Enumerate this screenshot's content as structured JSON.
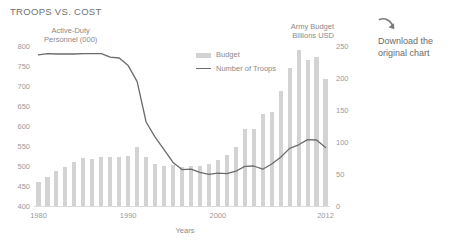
{
  "chart_data": {
    "type": "bar",
    "title": "TROOPS VS. COST",
    "xlabel": "Years",
    "ylabel": "Active-Duty Personnel (000)",
    "y2label": "Army Budget Billions USD",
    "ylim": [
      400,
      800
    ],
    "y2lim": [
      0,
      250
    ],
    "ytick_labels": [
      "800",
      "750",
      "700",
      "650",
      "600",
      "550",
      "500",
      "450",
      "400"
    ],
    "ytick_values": [
      800,
      750,
      700,
      650,
      600,
      550,
      500,
      450,
      400
    ],
    "y2tick_labels": [
      "250",
      "200",
      "150",
      "100",
      "50",
      "0"
    ],
    "y2tick_values": [
      250,
      200,
      150,
      100,
      50,
      0
    ],
    "xtick_labels": [
      "1980",
      "1990",
      "2000",
      "2012"
    ],
    "xtick_values": [
      1980,
      1990,
      2000,
      2012
    ],
    "grid": false,
    "legend_position": "inside-top-center",
    "categories": [
      1980,
      1981,
      1982,
      1983,
      1984,
      1985,
      1986,
      1987,
      1988,
      1989,
      1990,
      1991,
      1992,
      1993,
      1994,
      1995,
      1996,
      1997,
      1998,
      1999,
      2000,
      2001,
      2002,
      2003,
      2004,
      2005,
      2006,
      2007,
      2008,
      2009,
      2010,
      2011,
      2012
    ],
    "series": [
      {
        "name": "Budget",
        "type": "bar",
        "axis": "right",
        "units": "Billions USD",
        "color": "#d3d3d3",
        "values": [
          37,
          46,
          55,
          61,
          68,
          75,
          73,
          76,
          76,
          77,
          78,
          92,
          76,
          66,
          63,
          64,
          61,
          63,
          63,
          66,
          72,
          79,
          92,
          120,
          120,
          144,
          147,
          180,
          215,
          243,
          228,
          233,
          198
        ]
      },
      {
        "name": "Number of Troops",
        "type": "line",
        "axis": "left",
        "units": "thousands",
        "color": "#6b6b6b",
        "values": [
          778,
          781,
          780,
          780,
          780,
          781,
          781,
          781,
          772,
          770,
          751,
          711,
          610,
          572,
          541,
          509,
          491,
          492,
          484,
          479,
          482,
          481,
          487,
          499,
          500,
          492,
          505,
          522,
          544,
          553,
          566,
          565,
          546
        ]
      }
    ]
  },
  "sidebar": {
    "download_label": "Download the\noriginal chart",
    "download_line1": "Download the",
    "download_line2": "original chart",
    "arrow_icon": "download-arrow-icon"
  },
  "colors": {
    "bar": "#d3d3d3",
    "line": "#6b6b6b",
    "text": "#8a8a8a",
    "title": "#6f6f6f",
    "axis": "#dcdcdc",
    "background": "#ffffff"
  }
}
